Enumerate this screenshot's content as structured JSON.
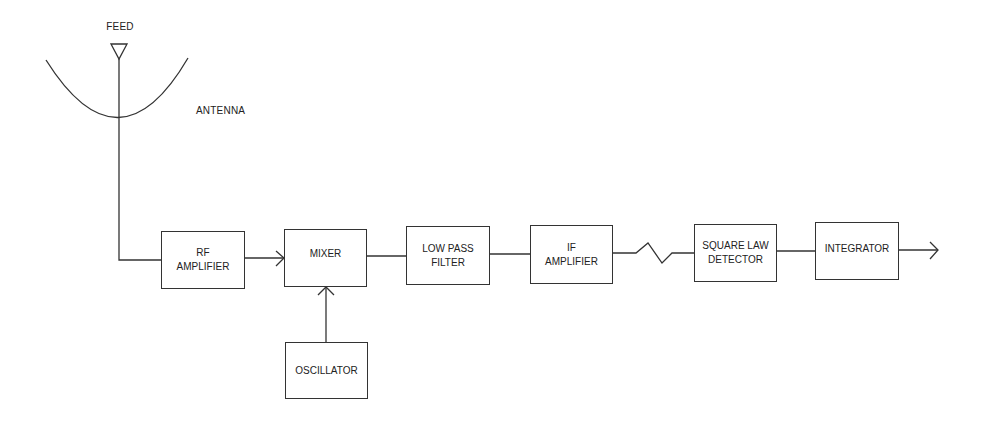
{
  "diagram": {
    "labels": {
      "feed": "FEED",
      "antenna": "ANTENNA"
    },
    "blocks": [
      {
        "id": "rf-amplifier",
        "lines": [
          "RF",
          "AMPLIFIER"
        ]
      },
      {
        "id": "mixer",
        "lines": [
          "MIXER"
        ]
      },
      {
        "id": "low-pass-filter",
        "lines": [
          "LOW PASS",
          "FILTER"
        ]
      },
      {
        "id": "if-amplifier",
        "lines": [
          "IF",
          "AMPLIFIER"
        ]
      },
      {
        "id": "square-law-detector",
        "lines": [
          "SQUARE LAW",
          "DETECTOR"
        ]
      },
      {
        "id": "integrator",
        "lines": [
          "INTEGRATOR"
        ]
      },
      {
        "id": "oscillator",
        "lines": [
          "OSCILLATOR"
        ]
      }
    ],
    "connections": [
      "antenna -> rf-amplifier",
      "rf-amplifier -> mixer",
      "oscillator -> mixer",
      "mixer -> low-pass-filter",
      "low-pass-filter -> if-amplifier",
      "if-amplifier -> square-law-detector",
      "square-law-detector -> integrator",
      "integrator -> output"
    ],
    "line_color": "#333333"
  }
}
